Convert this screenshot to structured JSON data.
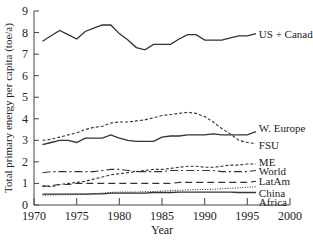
{
  "chart_data": {
    "type": "line",
    "title": "",
    "xlabel": "Year",
    "ylabel": "Total primary energy per capita (toe/a)",
    "xlim": [
      1970,
      2000
    ],
    "ylim": [
      0,
      9
    ],
    "xticks": [
      1970,
      1975,
      1980,
      1985,
      1990,
      1995,
      2000
    ],
    "yticks": [
      0,
      1,
      2,
      3,
      4,
      5,
      6,
      7,
      8,
      9
    ],
    "grid": false,
    "legend_position": "inline-right",
    "x": [
      1971,
      1972,
      1973,
      1974,
      1975,
      1976,
      1977,
      1978,
      1979,
      1980,
      1981,
      1982,
      1983,
      1984,
      1985,
      1986,
      1987,
      1988,
      1989,
      1990,
      1991,
      1992,
      1993,
      1994,
      1995,
      1996
    ],
    "series": [
      {
        "name": "US + Canada",
        "style": "solid",
        "values": [
          7.6,
          7.85,
          8.1,
          7.9,
          7.7,
          8.05,
          8.2,
          8.35,
          8.35,
          7.95,
          7.65,
          7.3,
          7.2,
          7.45,
          7.45,
          7.45,
          7.7,
          7.9,
          7.9,
          7.65,
          7.65,
          7.65,
          7.75,
          7.85,
          7.85,
          7.95
        ]
      },
      {
        "name": "W. Europe",
        "style": "solid",
        "values": [
          2.8,
          2.9,
          3.0,
          3.0,
          2.9,
          3.1,
          3.1,
          3.1,
          3.25,
          3.1,
          3.0,
          2.95,
          2.95,
          2.95,
          3.15,
          3.2,
          3.2,
          3.25,
          3.25,
          3.25,
          3.3,
          3.25,
          3.25,
          3.25,
          3.25,
          3.4
        ]
      },
      {
        "name": "FSU",
        "style": "dashed-short",
        "values": [
          3.0,
          3.05,
          3.15,
          3.25,
          3.35,
          3.5,
          3.6,
          3.65,
          3.8,
          3.85,
          3.85,
          3.9,
          3.95,
          4.05,
          4.15,
          4.2,
          4.25,
          4.3,
          4.25,
          4.1,
          3.85,
          3.55,
          3.3,
          3.0,
          2.9,
          2.85
        ]
      },
      {
        "name": "ME",
        "style": "dashed-short",
        "values": [
          0.9,
          0.85,
          0.95,
          1.0,
          1.05,
          1.1,
          1.2,
          1.3,
          1.4,
          1.45,
          1.5,
          1.55,
          1.6,
          1.65,
          1.65,
          1.7,
          1.75,
          1.8,
          1.8,
          1.75,
          1.75,
          1.8,
          1.85,
          1.85,
          1.9,
          1.9
        ]
      },
      {
        "name": "World",
        "style": "dash-dot",
        "values": [
          1.5,
          1.55,
          1.55,
          1.55,
          1.55,
          1.55,
          1.55,
          1.6,
          1.65,
          1.65,
          1.6,
          1.55,
          1.55,
          1.55,
          1.55,
          1.6,
          1.6,
          1.6,
          1.6,
          1.6,
          1.6,
          1.55,
          1.55,
          1.55,
          1.55,
          1.6
        ]
      },
      {
        "name": "LatAm",
        "style": "dashed-long",
        "values": [
          0.85,
          0.9,
          0.95,
          0.95,
          1.0,
          1.0,
          1.0,
          1.0,
          1.0,
          1.0,
          1.0,
          1.0,
          1.0,
          1.0,
          1.0,
          1.0,
          1.05,
          1.05,
          1.05,
          1.05,
          1.05,
          1.05,
          1.05,
          1.05,
          1.05,
          1.1
        ]
      },
      {
        "name": "China",
        "style": "dotted",
        "values": [
          0.45,
          0.47,
          0.48,
          0.48,
          0.5,
          0.5,
          0.52,
          0.55,
          0.58,
          0.6,
          0.6,
          0.6,
          0.62,
          0.62,
          0.65,
          0.67,
          0.68,
          0.7,
          0.72,
          0.72,
          0.73,
          0.75,
          0.78,
          0.8,
          0.82,
          0.85
        ]
      },
      {
        "name": "Africa",
        "style": "solid",
        "values": [
          0.5,
          0.5,
          0.5,
          0.5,
          0.5,
          0.5,
          0.52,
          0.52,
          0.55,
          0.55,
          0.55,
          0.55,
          0.55,
          0.58,
          0.58,
          0.58,
          0.6,
          0.6,
          0.6,
          0.6,
          0.6,
          0.6,
          0.6,
          0.58,
          0.58,
          0.58
        ]
      }
    ],
    "label_y_positions": {
      "US + Canada": 7.95,
      "W. Europe": 3.55,
      "FSU": 2.8,
      "ME": 2.0,
      "World": 1.6,
      "LatAm": 1.1,
      "China": 0.55,
      "Africa": 0.12
    }
  }
}
